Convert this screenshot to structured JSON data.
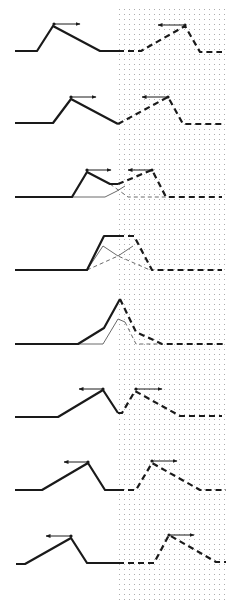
{
  "figure": {
    "width": 243,
    "height": 610,
    "background": "#ffffff",
    "ink_color": "#1a1a1a",
    "thin_color": "#444444",
    "dot_color": "#9a9a9a",
    "dotted_region": {
      "x0": 119,
      "x1": 228,
      "y0": 9,
      "y1": 600,
      "spacing": 5
    }
  },
  "panels": [
    {
      "id": 1,
      "solid": [
        [
          15,
          51
        ],
        [
          37,
          51
        ],
        [
          53,
          26
        ],
        [
          100,
          51
        ],
        [
          118,
          51
        ]
      ],
      "dashed": [
        [
          118,
          51
        ],
        [
          141,
          51
        ],
        [
          185,
          26
        ],
        [
          200,
          52
        ],
        [
          222,
          52
        ]
      ],
      "thin_solid": [],
      "thin_dashed": [],
      "arrows": [
        {
          "from": [
            54,
            24
          ],
          "to": [
            80,
            24
          ],
          "dot": [
            54,
            24
          ]
        },
        {
          "from": [
            185,
            25
          ],
          "to": [
            158,
            25
          ],
          "dot": [
            185,
            25
          ]
        }
      ]
    },
    {
      "id": 2,
      "solid": [
        [
          15,
          123
        ],
        [
          53,
          123
        ],
        [
          71,
          99
        ],
        [
          118,
          124
        ]
      ],
      "dashed": [
        [
          118,
          124
        ],
        [
          168,
          97
        ],
        [
          183,
          124
        ],
        [
          222,
          124
        ]
      ],
      "thin_solid": [],
      "thin_dashed": [],
      "arrows": [
        {
          "from": [
            71,
            97
          ],
          "to": [
            96,
            97
          ],
          "dot": [
            71,
            97
          ]
        },
        {
          "from": [
            168,
            97
          ],
          "to": [
            142,
            97
          ],
          "dot": [
            168,
            97
          ]
        }
      ]
    },
    {
      "id": 3,
      "solid": [
        [
          15,
          197
        ],
        [
          72,
          197
        ],
        [
          87,
          172
        ],
        [
          110,
          184
        ],
        [
          118,
          184
        ]
      ],
      "dashed": [
        [
          118,
          184
        ],
        [
          152,
          170
        ],
        [
          166,
          197
        ],
        [
          222,
          197
        ]
      ],
      "thin_solid": [
        [
          15,
          197
        ],
        [
          105,
          197
        ],
        [
          117,
          191
        ],
        [
          125,
          186
        ]
      ],
      "thin_dashed": [
        [
          110,
          184
        ],
        [
          128,
          197
        ],
        [
          166,
          197
        ]
      ],
      "arrows": [
        {
          "from": [
            87,
            170
          ],
          "to": [
            111,
            170
          ],
          "dot": [
            87,
            170
          ]
        },
        {
          "from": [
            152,
            170
          ],
          "to": [
            128,
            170
          ],
          "dot": [
            152,
            170
          ]
        }
      ]
    },
    {
      "id": 4,
      "solid": [
        [
          15,
          270
        ],
        [
          87,
          270
        ],
        [
          104,
          236
        ],
        [
          118,
          236
        ]
      ],
      "dashed": [
        [
          118,
          236
        ],
        [
          134,
          236
        ],
        [
          152,
          270
        ],
        [
          222,
          270
        ]
      ],
      "thin_solid": [
        [
          87,
          270
        ],
        [
          103,
          246
        ],
        [
          118,
          256
        ],
        [
          133,
          246
        ]
      ],
      "thin_dashed": [
        [
          87,
          270
        ],
        [
          118,
          256
        ],
        [
          150,
          270
        ]
      ],
      "arrows": []
    },
    {
      "id": 5,
      "solid": [
        [
          15,
          344
        ],
        [
          78,
          344
        ],
        [
          104,
          328
        ],
        [
          120,
          299
        ]
      ],
      "dashed": [
        [
          120,
          299
        ],
        [
          136,
          332
        ],
        [
          162,
          344
        ],
        [
          225,
          344
        ]
      ],
      "thin_solid": [
        [
          78,
          344
        ],
        [
          103,
          344
        ],
        [
          118,
          319
        ],
        [
          125,
          322
        ]
      ],
      "thin_dashed": [
        [
          125,
          322
        ],
        [
          136,
          344
        ],
        [
          162,
          344
        ]
      ],
      "arrows": []
    },
    {
      "id": 6,
      "solid": [
        [
          15,
          417
        ],
        [
          58,
          417
        ],
        [
          103,
          390
        ],
        [
          118,
          413
        ]
      ],
      "dashed": [
        [
          118,
          413
        ],
        [
          122,
          413
        ],
        [
          135,
          391
        ],
        [
          180,
          416
        ],
        [
          222,
          416
        ]
      ],
      "thin_solid": [],
      "thin_dashed": [],
      "arrows": [
        {
          "from": [
            103,
            389
          ],
          "to": [
            79,
            389
          ],
          "dot": [
            103,
            389
          ]
        },
        {
          "from": [
            136,
            389
          ],
          "to": [
            162,
            389
          ],
          "dot": [
            136,
            389
          ]
        }
      ]
    },
    {
      "id": 7,
      "solid": [
        [
          15,
          490
        ],
        [
          42,
          490
        ],
        [
          88,
          463
        ],
        [
          105,
          490
        ],
        [
          118,
          490
        ]
      ],
      "dashed": [
        [
          118,
          490
        ],
        [
          136,
          490
        ],
        [
          152,
          463
        ],
        [
          200,
          490
        ],
        [
          226,
          490
        ]
      ],
      "thin_solid": [],
      "thin_dashed": [],
      "arrows": [
        {
          "from": [
            88,
            462
          ],
          "to": [
            64,
            462
          ],
          "dot": [
            88,
            462
          ]
        },
        {
          "from": [
            152,
            461
          ],
          "to": [
            177,
            461
          ],
          "dot": [
            152,
            461
          ]
        }
      ]
    },
    {
      "id": 8,
      "solid": [
        [
          16,
          564
        ],
        [
          25,
          564
        ],
        [
          71,
          538
        ],
        [
          87,
          563
        ],
        [
          118,
          563
        ]
      ],
      "dashed": [
        [
          118,
          563
        ],
        [
          154,
          563
        ],
        [
          169,
          535
        ],
        [
          216,
          562
        ],
        [
          226,
          562
        ]
      ],
      "thin_solid": [],
      "thin_dashed": [],
      "arrows": [
        {
          "from": [
            71,
            536
          ],
          "to": [
            46,
            536
          ],
          "dot": [
            71,
            536
          ]
        },
        {
          "from": [
            169,
            535
          ],
          "to": [
            194,
            535
          ],
          "dot": [
            169,
            535
          ]
        }
      ]
    }
  ]
}
